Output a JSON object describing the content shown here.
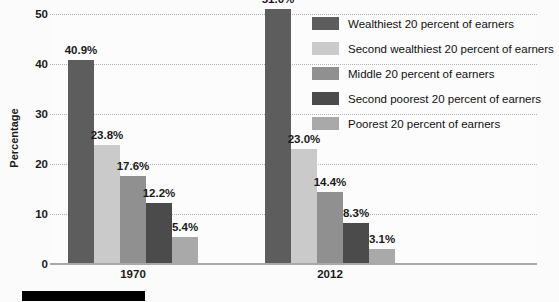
{
  "chart_data": {
    "type": "bar",
    "title": "",
    "xlabel": "",
    "ylabel": "Percentage",
    "ylim": [
      0,
      50
    ],
    "yticks": [
      0,
      10,
      20,
      30,
      40,
      50
    ],
    "ytick_labels": [
      "0",
      "10",
      "20",
      "30",
      "40",
      "50"
    ],
    "grid": true,
    "legend_position": "top-right",
    "categories": [
      "1970",
      "2012"
    ],
    "series": [
      {
        "name": "Wealthiest 20 percent of earners",
        "color": "#5d5d5d",
        "values": [
          40.9,
          51.0
        ],
        "labels": [
          "40.9%",
          "51.0%"
        ]
      },
      {
        "name": "Second wealthiest 20 percent of earners",
        "color": "#cacaca",
        "values": [
          23.8,
          23.0
        ],
        "labels": [
          "23.8%",
          "23.0%"
        ]
      },
      {
        "name": "Middle 20 percent of earners",
        "color": "#909090",
        "values": [
          17.6,
          14.4
        ],
        "labels": [
          "17.6%",
          "14.4%"
        ]
      },
      {
        "name": "Second poorest 20 percent of earners",
        "color": "#4b4b4b",
        "values": [
          12.2,
          8.3
        ],
        "labels": [
          "12.2%",
          "8.3%"
        ]
      },
      {
        "name": "Poorest 20 percent of earners",
        "color": "#a9a9a9",
        "values": [
          5.4,
          3.1
        ],
        "labels": [
          "5.4%",
          "3.1%"
        ]
      }
    ]
  },
  "axis": {
    "y_title": "Percentage",
    "tick_0": "0",
    "tick_1": "10",
    "tick_2": "20",
    "tick_3": "30",
    "tick_4": "40",
    "tick_5": "50"
  },
  "groups": {
    "g0_label": "1970",
    "g1_label": "2012"
  },
  "legend": {
    "items": [
      {
        "label": "Wealthiest 20 percent of earners",
        "color": "#5d5d5d"
      },
      {
        "label": "Second wealthiest 20 percent of earners",
        "color": "#cacaca"
      },
      {
        "label": "Middle 20 percent of earners",
        "color": "#909090"
      },
      {
        "label": "Second poorest 20 percent of earners",
        "color": "#4b4b4b"
      },
      {
        "label": "Poorest 20 percent of earners",
        "color": "#a9a9a9"
      }
    ]
  },
  "bar_labels": {
    "g0": [
      "40.9%",
      "23.8%",
      "17.6%",
      "12.2%",
      "5.4%"
    ],
    "g1": [
      "51.0%",
      "23.0%",
      "14.4%",
      "8.3%",
      "3.1%"
    ]
  }
}
